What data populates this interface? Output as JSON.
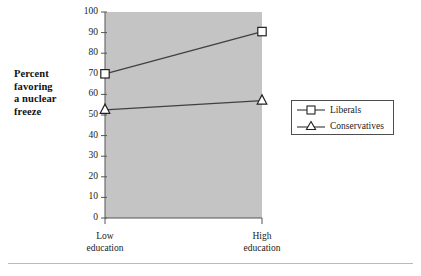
{
  "chart_data": {
    "type": "line",
    "title": "",
    "xlabel": "",
    "ylabel": "Percent favoring a nuclear freeze",
    "categories": [
      "Low education",
      "High education"
    ],
    "category_lines": [
      [
        "Low",
        "education"
      ],
      [
        "High",
        "education"
      ]
    ],
    "ylim": [
      0,
      100
    ],
    "yticks": [
      0,
      10,
      20,
      30,
      40,
      50,
      60,
      70,
      80,
      90,
      100
    ],
    "ytick_labels": [
      "0",
      "10",
      "20",
      "30",
      "40",
      "50",
      "60",
      "70",
      "80",
      "90",
      "100"
    ],
    "grid": false,
    "legend_position": "right",
    "plot_background": "#c4c4c4",
    "line_color": "#404040",
    "series": [
      {
        "name": "Liberals",
        "marker": "open-square",
        "values": [
          70,
          90.5
        ]
      },
      {
        "name": "Conservatives",
        "marker": "open-triangle",
        "values": [
          52.5,
          57
        ]
      }
    ]
  },
  "axis": {
    "y_title_lines": [
      "Percent",
      "favoring",
      "a nuclear",
      "freeze"
    ]
  },
  "legend": {
    "entries": [
      {
        "label": "Liberals",
        "marker": "open-square"
      },
      {
        "label": "Conservatives",
        "marker": "open-triangle"
      }
    ]
  }
}
